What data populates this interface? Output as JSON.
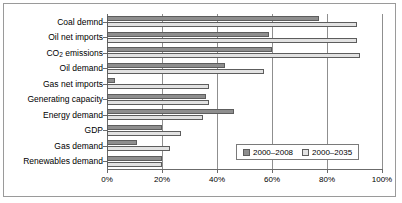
{
  "chart_data": {
    "type": "bar",
    "orientation": "horizontal",
    "title": "",
    "subtitle": "",
    "xlabel": "",
    "ylabel": "",
    "xlim": [
      0,
      100
    ],
    "xtick_labels": [
      "0%",
      "20%",
      "40%",
      "60%",
      "80%",
      "100%"
    ],
    "xticks": [
      0,
      20,
      40,
      60,
      80,
      100
    ],
    "grid": true,
    "grid_axis": "x",
    "legend_position": "lower-right-inside",
    "categories": [
      "Coal demnd",
      "Oil net imports",
      "CO2 emissions",
      "Oil demand",
      "Gas net imports",
      "Generating capacity",
      "Energy demand",
      "GDP",
      "Gas demand",
      "Renewables demand"
    ],
    "series": [
      {
        "name": "2000–2008",
        "color": "#8e8e8e",
        "values": [
          77,
          59,
          60,
          43,
          3,
          36,
          46,
          20,
          11,
          20
        ]
      },
      {
        "name": "2000–2035",
        "color": "#e2e2e2",
        "values": [
          91,
          91,
          92,
          57,
          37,
          37,
          35,
          27,
          23,
          20
        ]
      }
    ]
  },
  "legend": {
    "entries": [
      {
        "label": "2000–2008",
        "swatch": "s0"
      },
      {
        "label": "2000–2035",
        "swatch": "s1"
      }
    ]
  }
}
